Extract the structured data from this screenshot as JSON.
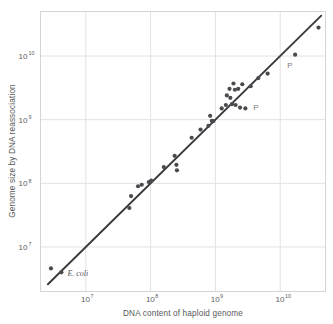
{
  "figure": {
    "background_color": "#ffffff",
    "frame_color": "#d5d5d7",
    "grid_color": "#e2e2e4",
    "point_color": "#4a4a4f",
    "line_color": "#3a3a3e"
  },
  "chart_data": {
    "type": "scatter",
    "title": "",
    "xlabel": "DNA content of haploid genome",
    "ylabel": "Genome size by DNA reassociation",
    "xscale": "log",
    "yscale": "log",
    "xlim": [
      2000000,
      50000000000
    ],
    "ylim": [
      2000000,
      50000000000
    ],
    "grid": true,
    "legend": "none",
    "xticks": [
      {
        "value": 10000000,
        "label": "10",
        "exponent": "7"
      },
      {
        "value": 100000000,
        "label": "10",
        "exponent": "8"
      },
      {
        "value": 1000000000,
        "label": "10",
        "exponent": "9"
      },
      {
        "value": 10000000000,
        "label": "10",
        "exponent": "10"
      }
    ],
    "yticks": [
      {
        "value": 10000000,
        "label": "10",
        "exponent": "7"
      },
      {
        "value": 100000000,
        "label": "10",
        "exponent": "8"
      },
      {
        "value": 1000000000,
        "label": "10",
        "exponent": "9"
      },
      {
        "value": 10000000000,
        "label": "10",
        "exponent": "10"
      }
    ],
    "reference_line": {
      "description": "one-to-one identity line",
      "x": [
        2600000,
        43000000000
      ],
      "y": [
        2600000,
        43000000000
      ]
    },
    "points": [
      {
        "x": 2900000,
        "y": 4600000
      },
      {
        "x": 4200000,
        "y": 4000000
      },
      {
        "x": 47000000,
        "y": 41000000
      },
      {
        "x": 50000000,
        "y": 63000000
      },
      {
        "x": 64000000,
        "y": 90000000
      },
      {
        "x": 73000000,
        "y": 95000000
      },
      {
        "x": 94000000,
        "y": 105000000
      },
      {
        "x": 102000000,
        "y": 110000000
      },
      {
        "x": 160000000,
        "y": 180000000
      },
      {
        "x": 235000000,
        "y": 270000000
      },
      {
        "x": 250000000,
        "y": 195000000
      },
      {
        "x": 255000000,
        "y": 160000000
      },
      {
        "x": 430000000,
        "y": 520000000
      },
      {
        "x": 590000000,
        "y": 700000000
      },
      {
        "x": 780000000,
        "y": 800000000
      },
      {
        "x": 830000000,
        "y": 1150000000
      },
      {
        "x": 880000000,
        "y": 960000000
      },
      {
        "x": 930000000,
        "y": 950000000
      },
      {
        "x": 1250000000,
        "y": 1500000000
      },
      {
        "x": 1450000000,
        "y": 1700000000
      },
      {
        "x": 1500000000,
        "y": 2400000000
      },
      {
        "x": 1650000000,
        "y": 3050000000
      },
      {
        "x": 1700000000,
        "y": 2200000000
      },
      {
        "x": 1800000000,
        "y": 1750000000
      },
      {
        "x": 1900000000,
        "y": 3700000000
      },
      {
        "x": 2000000000,
        "y": 2950000000
      },
      {
        "x": 2050000000,
        "y": 1700000000
      },
      {
        "x": 2250000000,
        "y": 3050000000
      },
      {
        "x": 2400000000,
        "y": 1550000000
      },
      {
        "x": 2600000000,
        "y": 3600000000
      },
      {
        "x": 2900000000,
        "y": 1500000000
      },
      {
        "x": 3500000000,
        "y": 3350000000
      },
      {
        "x": 4600000000,
        "y": 4500000000
      },
      {
        "x": 6400000000,
        "y": 5300000000
      },
      {
        "x": 17000000000,
        "y": 10500000000
      },
      {
        "x": 39000000000,
        "y": 28000000000
      }
    ],
    "annotations": [
      {
        "text": "E. coli",
        "x": 4200000,
        "y": 4000000,
        "style": "italic-serif",
        "dx": 6,
        "dy": 4
      },
      {
        "text": "P",
        "x": 2900000000,
        "y": 1500000000,
        "style": "plain",
        "dx": 8,
        "dy": 2
      },
      {
        "text": "P",
        "x": 17000000000,
        "y": 10500000000,
        "style": "plain",
        "dx": -8,
        "dy": 13
      }
    ]
  }
}
